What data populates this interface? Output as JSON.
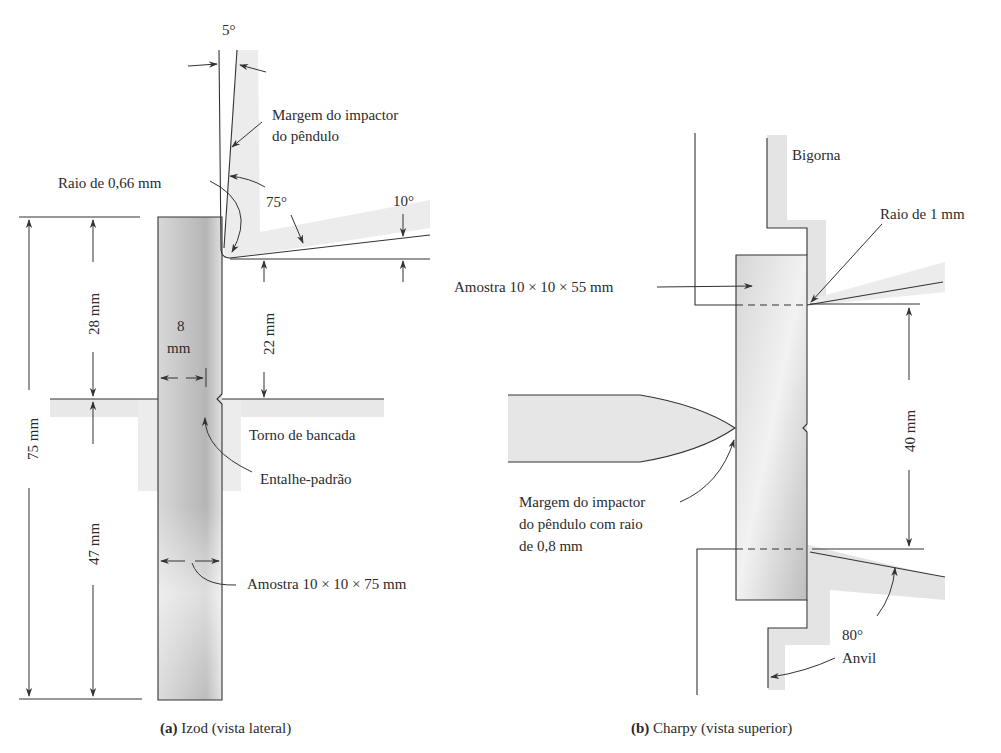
{
  "figure": {
    "panel_a": {
      "caption_prefix": "(a)",
      "caption_text": " Izod (vista lateral)",
      "labels": {
        "angle_top": "5°",
        "impactor_edge_line1": "Margem do impactor",
        "impactor_edge_line2": "do pêndulo",
        "radius": "Raio de 0,66 mm",
        "angle_75": "75°",
        "angle_10": "10°",
        "dim_28": "28 mm",
        "dim_22": "22 mm",
        "dim_8_line1": "8",
        "dim_8_line2": "mm",
        "dim_75": "75 mm",
        "dim_47": "47 mm",
        "vise": "Torno de bancada",
        "notch": "Entalhe-padrão",
        "specimen": "Amostra 10 × 10 × 75 mm"
      }
    },
    "panel_b": {
      "caption_prefix": "(b)",
      "caption_text": " Charpy (vista superior)",
      "labels": {
        "anvil_top": "Bigorna",
        "radius": "Raio de 1 mm",
        "specimen": "Amostra 10 × 10 × 55 mm",
        "dim_40": "40 mm",
        "impactor_line1": "Margem do impactor",
        "impactor_line2": "do pêndulo com raio",
        "impactor_line3": "de 0,8 mm",
        "angle_80": "80°",
        "anvil_bottom": "Anvil"
      }
    },
    "colors": {
      "line": "#333333",
      "shade_dark": "#b8b8b8",
      "shade_light": "#e6e6e6",
      "text": "#2b2b2b"
    }
  }
}
